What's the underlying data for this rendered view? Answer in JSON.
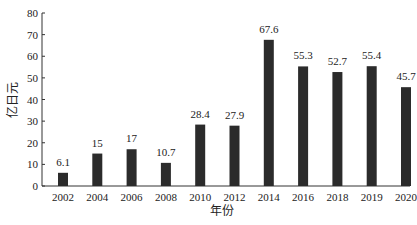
{
  "chart_data": {
    "type": "bar",
    "title": "",
    "xlabel": "年份",
    "ylabel": "亿日元",
    "ylim": [
      0,
      80
    ],
    "yticks": [
      0,
      10,
      20,
      30,
      40,
      50,
      60,
      70,
      80
    ],
    "grid": false,
    "legend": null,
    "categories": [
      "2002",
      "2004",
      "2006",
      "2008",
      "2010",
      "2012",
      "2014",
      "2016",
      "2018",
      "2019",
      "2020"
    ],
    "values": [
      6.1,
      15,
      17,
      10.7,
      28.4,
      27.9,
      67.6,
      55.3,
      52.7,
      55.4,
      45.7
    ],
    "value_labels": [
      "6.1",
      "15",
      "17",
      "10.7",
      "28.4",
      "27.9",
      "67.6",
      "55.3",
      "52.7",
      "55.4",
      "45.7"
    ],
    "bar_color": "#2b2b2b"
  }
}
